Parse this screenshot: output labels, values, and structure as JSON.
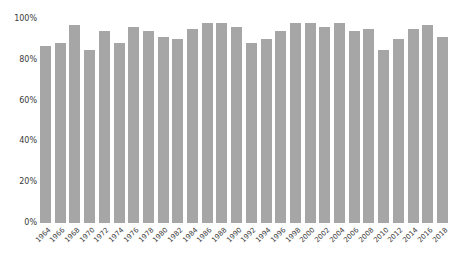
{
  "chart_data": {
    "type": "bar",
    "title": "",
    "xlabel": "",
    "ylabel": "",
    "categories": [
      "1964",
      "1966",
      "1968",
      "1970",
      "1972",
      "1974",
      "1976",
      "1978",
      "1980",
      "1982",
      "1984",
      "1986",
      "1988",
      "1990",
      "1992",
      "1994",
      "1996",
      "1998",
      "2000",
      "2002",
      "2004",
      "2006",
      "2008",
      "2010",
      "2012",
      "2014",
      "2016",
      "2018"
    ],
    "values": [
      87,
      88,
      97,
      85,
      94,
      88,
      96,
      94,
      91,
      90,
      95,
      98,
      98,
      96,
      88,
      90,
      94,
      98,
      98,
      96,
      98,
      94,
      95,
      85,
      90,
      95,
      97,
      91
    ],
    "unit": "%",
    "ylim": [
      0,
      100
    ],
    "y_ticks": [
      {
        "value": 0,
        "label": "0%"
      },
      {
        "value": 20,
        "label": "20%"
      },
      {
        "value": 40,
        "label": "40%"
      },
      {
        "value": 60,
        "label": "60%"
      },
      {
        "value": 80,
        "label": "80%"
      },
      {
        "value": 100,
        "label": "100%"
      }
    ],
    "grid": false,
    "legend": "none",
    "bar_color": "#a6a6a6",
    "tick_text_color": "#3a3a3a",
    "background_color": "#ffffff"
  }
}
